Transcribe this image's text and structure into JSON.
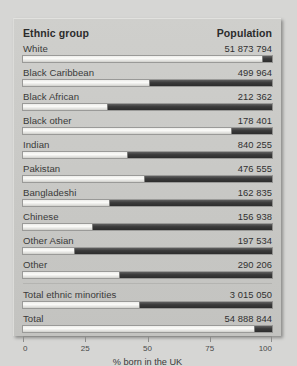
{
  "header": {
    "group_label": "Ethnic group",
    "population_label": "Population"
  },
  "chart_data": {
    "type": "bar",
    "title": "",
    "xlabel": "% born in the UK",
    "ylabel": "",
    "xlim": [
      0,
      100
    ],
    "xticks": [
      "0",
      "25",
      "50",
      "75",
      "100"
    ],
    "grid": false,
    "legend": "none",
    "orientation": "horizontal",
    "categories": [
      "White",
      "Black Caribbean",
      "Black African",
      "Black other",
      "Indian",
      "Pakistan",
      "Bangladeshi",
      "Chinese",
      "Other Asian",
      "Other",
      "Total ethnic minorities",
      "Total"
    ],
    "series": [
      {
        "name": "% born in the UK",
        "values": [
          96.5,
          51.0,
          34.0,
          84.0,
          42.0,
          49.0,
          35.0,
          28.0,
          21.0,
          39.0,
          47.0,
          93.0
        ]
      }
    ],
    "population_labels": [
      "51 873 794",
      "499 964",
      "212 362",
      "178 401",
      "840 255",
      "476 555",
      "162 835",
      "156 938",
      "197 534",
      "290 206",
      "3 015 050",
      "54 888 844"
    ]
  },
  "rows": [
    {
      "label": "White",
      "population": "51 873 794",
      "percent": 96.5,
      "totals_group": false
    },
    {
      "label": "Black Caribbean",
      "population": "499 964",
      "percent": 51.0,
      "totals_group": false
    },
    {
      "label": "Black African",
      "population": "212 362",
      "percent": 34.0,
      "totals_group": false
    },
    {
      "label": "Black other",
      "population": "178 401",
      "percent": 84.0,
      "totals_group": false
    },
    {
      "label": "Indian",
      "population": "840 255",
      "percent": 42.0,
      "totals_group": false
    },
    {
      "label": "Pakistan",
      "population": "476 555",
      "percent": 49.0,
      "totals_group": false
    },
    {
      "label": "Bangladeshi",
      "population": "162 835",
      "percent": 35.0,
      "totals_group": false
    },
    {
      "label": "Chinese",
      "population": "156 938",
      "percent": 28.0,
      "totals_group": false
    },
    {
      "label": "Other Asian",
      "population": "197 534",
      "percent": 21.0,
      "totals_group": false
    },
    {
      "label": "Other",
      "population": "290 206",
      "percent": 39.0,
      "totals_group": false
    },
    {
      "label": "Total ethnic minorities",
      "population": "3 015 050",
      "percent": 47.0,
      "totals_group": true
    },
    {
      "label": "Total",
      "population": "54 888 844",
      "percent": 93.0,
      "totals_group": false
    }
  ],
  "axis": {
    "ticks": [
      "0",
      "25",
      "50",
      "75",
      "100"
    ],
    "tick_positions": [
      0,
      25,
      50,
      75,
      100
    ],
    "title": "% born in the UK"
  },
  "colors": {
    "panel_bg": "#c8c8c5",
    "page_bg": "#d6d6d4",
    "bar_filled": "#fbfbf9",
    "bar_empty": "#333333",
    "text": "#3a3a3a"
  }
}
